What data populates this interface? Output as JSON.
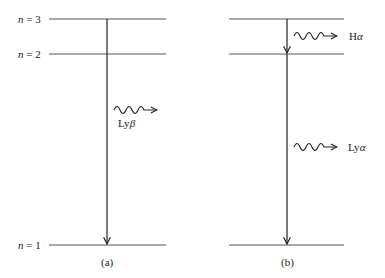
{
  "panel_a": {
    "caption": "(a)",
    "levels": [
      {
        "label_n": "n",
        "label_eq": " = 3"
      },
      {
        "label_n": "n",
        "label_eq": " = 2"
      },
      {
        "label_n": "n",
        "label_eq": " = 1"
      }
    ],
    "transition": {
      "from": 3,
      "to": 1,
      "photon_label_prefix": "Ly",
      "photon_label_greek": "β"
    }
  },
  "panel_b": {
    "caption": "(b)",
    "transitions": [
      {
        "from": 3,
        "to": 2,
        "photon_label_prefix": "H",
        "photon_label_greek": "α"
      },
      {
        "from": 2,
        "to": 1,
        "photon_label_prefix": "Ly",
        "photon_label_greek": "α"
      }
    ]
  },
  "colors": {
    "line": "#222222",
    "level": "#555555"
  }
}
